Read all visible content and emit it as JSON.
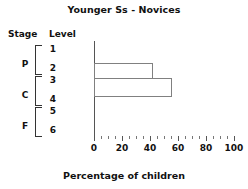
{
  "chart_data": {
    "type": "bar",
    "orientation": "horizontal",
    "title": "Younger Ss - Novices",
    "xlabel": "Percentage of children",
    "ylabel": "",
    "xlim": [
      0,
      100
    ],
    "xticks": [
      0,
      20,
      40,
      60,
      80,
      100
    ],
    "xtick_labels": [
      "0",
      "20",
      "40",
      "60",
      "80",
      "100"
    ],
    "minor_tick_step": 5,
    "grid": false,
    "legend": false,
    "row_headers": {
      "stage": "Stage",
      "level": "Level"
    },
    "stages": [
      {
        "letter": "P",
        "levels": [
          "1",
          "2"
        ]
      },
      {
        "letter": "C",
        "levels": [
          "3",
          "4"
        ]
      },
      {
        "letter": "F",
        "levels": [
          "5",
          "6"
        ]
      }
    ],
    "categories": [
      "1",
      "2",
      "3",
      "4",
      "5",
      "6"
    ],
    "values": [
      0,
      42,
      42,
      56,
      0,
      0
    ],
    "bars": [
      {
        "label": "Level 2-3 band",
        "value": 42,
        "span_from": "2",
        "span_to": "3"
      },
      {
        "label": "Level 3-4 band",
        "value": 56,
        "span_from": "3",
        "span_to": "4"
      }
    ],
    "colors": {
      "bar_fill": "#ffffff",
      "bar_edge": "#808080",
      "axis": "#555555",
      "text": "#111111",
      "background": "#ffffff"
    }
  }
}
